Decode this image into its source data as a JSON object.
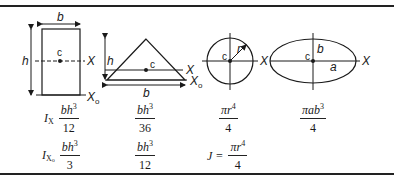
{
  "figures": {
    "rectangle": {
      "width_label": "b",
      "height_label": "h",
      "centroid_label": "c",
      "axis_label": "X",
      "base_axis_label": "X",
      "base_axis_sub": "o"
    },
    "triangle": {
      "width_label": "b",
      "height_label": "h",
      "centroid_label": "c",
      "axis_label": "X",
      "base_axis_label": "X",
      "base_axis_sub": "o"
    },
    "circle": {
      "radius_label": "r",
      "centroid_label": "c",
      "axis_label_left": "X",
      "axis_label_right": "X"
    },
    "ellipse": {
      "semi_major_label": "a",
      "semi_minor_label": "b",
      "centroid_label": "c",
      "axis_label": "X"
    }
  },
  "formulas": {
    "row1": {
      "label": "I",
      "label_sub": "X",
      "rectangle": {
        "num": "bh",
        "num_exp": "3",
        "den": "12"
      },
      "triangle": {
        "num": "bh",
        "num_exp": "3",
        "den": "36"
      },
      "circle": {
        "num": "πr",
        "num_exp": "4",
        "den": "4"
      },
      "ellipse": {
        "num": "πab",
        "num_exp": "3",
        "den": "4"
      }
    },
    "row2": {
      "label": "I",
      "label_sub": "X",
      "label_subsub": "o",
      "rectangle": {
        "num": "bh",
        "num_exp": "3",
        "den": "3"
      },
      "triangle": {
        "num": "bh",
        "num_exp": "3",
        "den": "12"
      },
      "circle": {
        "prefix": "J =",
        "num": "πr",
        "num_exp": "4",
        "den": "4"
      }
    }
  }
}
